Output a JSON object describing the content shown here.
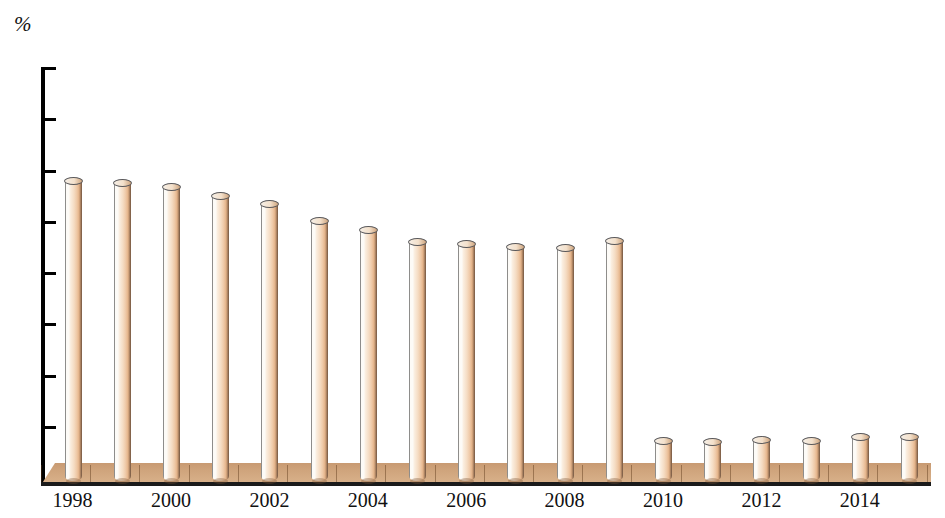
{
  "chart_data": {
    "type": "bar",
    "title": "",
    "subtitle": "",
    "xlabel": "",
    "ylabel": "%",
    "unit_label": "%",
    "ylim": [
      10,
      50
    ],
    "y_ticks": [
      50,
      45,
      40,
      35,
      30,
      25,
      20,
      15,
      10
    ],
    "grid": false,
    "legend": null,
    "legend_position": "none",
    "bar_style": "3d-cylinder",
    "categories": [
      "1998",
      "1999",
      "2000",
      "2001",
      "2002",
      "2003",
      "2004",
      "2005",
      "2006",
      "2007",
      "2008",
      "2009",
      "2010",
      "2011",
      "2012",
      "2013",
      "2014",
      "2015"
    ],
    "x_tick_labels": [
      "1998",
      "2000",
      "2002",
      "2004",
      "2006",
      "2008",
      "2010",
      "2012",
      "2014"
    ],
    "x_tick_categories": [
      "1998",
      "2000",
      "2002",
      "2004",
      "2006",
      "2008",
      "2010",
      "2012",
      "2014"
    ],
    "values": [
      39.0,
      38.8,
      38.4,
      37.5,
      36.7,
      35.1,
      34.2,
      33.0,
      32.8,
      32.5,
      32.4,
      33.1,
      13.6,
      13.5,
      13.7,
      13.6,
      14.0,
      14.0
    ],
    "colors": {
      "bar_light": "#fdfbf7",
      "bar_mid": "#f5dcc3",
      "bar_dark": "#e3b288",
      "bar_edge": "#6e5340",
      "floor": "#cfa47c",
      "axis": "#000000",
      "text": "#111111",
      "background": "#ffffff"
    }
  }
}
